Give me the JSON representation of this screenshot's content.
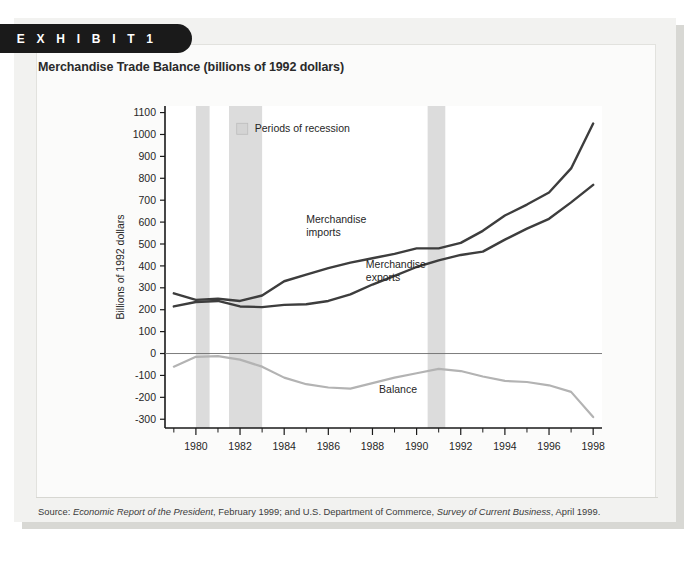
{
  "exhibit": {
    "tab_label": "E X H I B I T   1"
  },
  "chart_title": "Merchandise Trade Balance (billions of 1992 dollars)",
  "source": {
    "prefix": "Source: ",
    "italic_1": "Economic Report of the President",
    "mid": ", February 1999; and U.S. Department of Commerce, ",
    "italic_2": "Survey of Current Business",
    "suffix": ", April 1999."
  },
  "legend": {
    "recession_label": "Periods of recession",
    "recession_color": "#d4d4d4"
  },
  "annotations": {
    "imports_label_line1": "Merchandise",
    "imports_label_line2": "imports",
    "exports_label_line1": "Merchandise",
    "exports_label_line2": "exports",
    "balance_label": "Balance"
  },
  "colors": {
    "imports": "#3d3d3d",
    "exports": "#3d3d3d",
    "balance": "#b3b3b3",
    "axis": "#1a1a1a",
    "recession_band": "#dcdcdc",
    "plot_bg": "#ffffff",
    "panel_bg": "#f2f2f0",
    "tab_bg": "#1a1a1a"
  },
  "chart_data": {
    "type": "line",
    "title": "Merchandise Trade Balance (billions of 1992 dollars)",
    "xlabel": "",
    "ylabel": "Billions of 1992 dollars",
    "xlim": [
      1978.6,
      1998.4
    ],
    "ylim": [
      -340,
      1130
    ],
    "grid": false,
    "legend_position": "inside-top-left",
    "yticks": [
      -300,
      -200,
      -100,
      0,
      100,
      200,
      300,
      400,
      500,
      600,
      700,
      800,
      900,
      1000,
      1100
    ],
    "ytick_labels": [
      "-300",
      "-200",
      "-100",
      "0",
      "100",
      "200",
      "300",
      "400",
      "500",
      "600",
      "700",
      "800",
      "900",
      "1000",
      "1100"
    ],
    "xticks_major": [
      1980,
      1982,
      1984,
      1986,
      1988,
      1990,
      1992,
      1994,
      1996,
      1998
    ],
    "xtick_labels": [
      "1980",
      "1982",
      "1984",
      "1986",
      "1988",
      "1990",
      "1992",
      "1994",
      "1996",
      "1998"
    ],
    "xticks_minor": [
      1979,
      1981,
      1983,
      1985,
      1987,
      1989,
      1991,
      1993,
      1995,
      1997
    ],
    "zero_line": 0,
    "x": [
      1979,
      1980,
      1981,
      1982,
      1983,
      1984,
      1985,
      1986,
      1987,
      1988,
      1989,
      1990,
      1991,
      1992,
      1993,
      1994,
      1995,
      1996,
      1997,
      1998
    ],
    "series": [
      {
        "name": "Merchandise imports",
        "color": "#3d3d3d",
        "values": [
          275,
          245,
          250,
          240,
          265,
          330,
          360,
          390,
          415,
          435,
          455,
          480,
          480,
          505,
          560,
          630,
          680,
          735,
          845,
          1050
        ]
      },
      {
        "name": "Merchandise exports",
        "color": "#3d3d3d",
        "values": [
          215,
          235,
          240,
          215,
          212,
          222,
          225,
          240,
          270,
          315,
          355,
          395,
          425,
          450,
          465,
          520,
          570,
          615,
          690,
          770
        ]
      },
      {
        "name": "Balance",
        "color": "#b3b3b3",
        "values": [
          -60,
          -15,
          -12,
          -28,
          -60,
          -110,
          -140,
          -155,
          -160,
          -135,
          -110,
          -90,
          -70,
          -80,
          -105,
          -125,
          -130,
          -145,
          -175,
          -290
        ]
      }
    ],
    "recession_bands": [
      {
        "start": 1980.0,
        "end": 1980.62
      },
      {
        "start": 1981.5,
        "end": 1983.0
      },
      {
        "start": 1990.5,
        "end": 1991.3
      }
    ]
  }
}
